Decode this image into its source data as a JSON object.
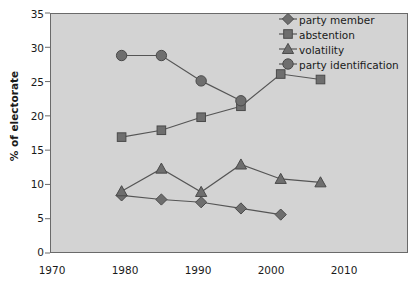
{
  "chart_data": {
    "type": "line",
    "title": "",
    "xlabel": "",
    "ylabel": "% of electorate",
    "xlim": [
      1970,
      2015
    ],
    "ylim": [
      0,
      35
    ],
    "grid": false,
    "legend_position": "top-right",
    "xticks": [
      "1970",
      "1980",
      "1990",
      "2000",
      "2010"
    ],
    "xtick_values": [
      1970,
      1980,
      1990,
      2000,
      2010
    ],
    "yticks": [
      "0",
      "5",
      "10",
      "15",
      "20",
      "25",
      "30",
      "35"
    ],
    "ytick_values": [
      0,
      5,
      10,
      15,
      20,
      25,
      30,
      35
    ],
    "series": [
      {
        "name": "party member",
        "marker": "diamond",
        "x": [
          1979,
          1984,
          1989,
          1994,
          1999
        ],
        "values": [
          8.4,
          7.8,
          7.4,
          6.5,
          5.6
        ]
      },
      {
        "name": "abstention",
        "marker": "square",
        "x": [
          1979,
          1984,
          1989,
          1994,
          1999,
          2004
        ],
        "values": [
          16.9,
          17.9,
          19.8,
          21.4,
          26.1,
          25.3
        ]
      },
      {
        "name": "volatility",
        "marker": "triangle",
        "x": [
          1979,
          1984,
          1989,
          1994,
          1999,
          2004
        ],
        "values": [
          9.0,
          12.3,
          8.9,
          12.9,
          10.8,
          10.3
        ]
      },
      {
        "name": "party identification",
        "marker": "circle",
        "x": [
          1979,
          1984,
          1989,
          1994
        ],
        "values": [
          28.8,
          28.8,
          25.1,
          22.2
        ]
      }
    ],
    "colors": {
      "plot_background": "#d3d3d3",
      "axis": "#6a6a6a",
      "series_marker": "#6e6e6e",
      "series_line": "#555555",
      "text": "#1a1a1a"
    }
  }
}
